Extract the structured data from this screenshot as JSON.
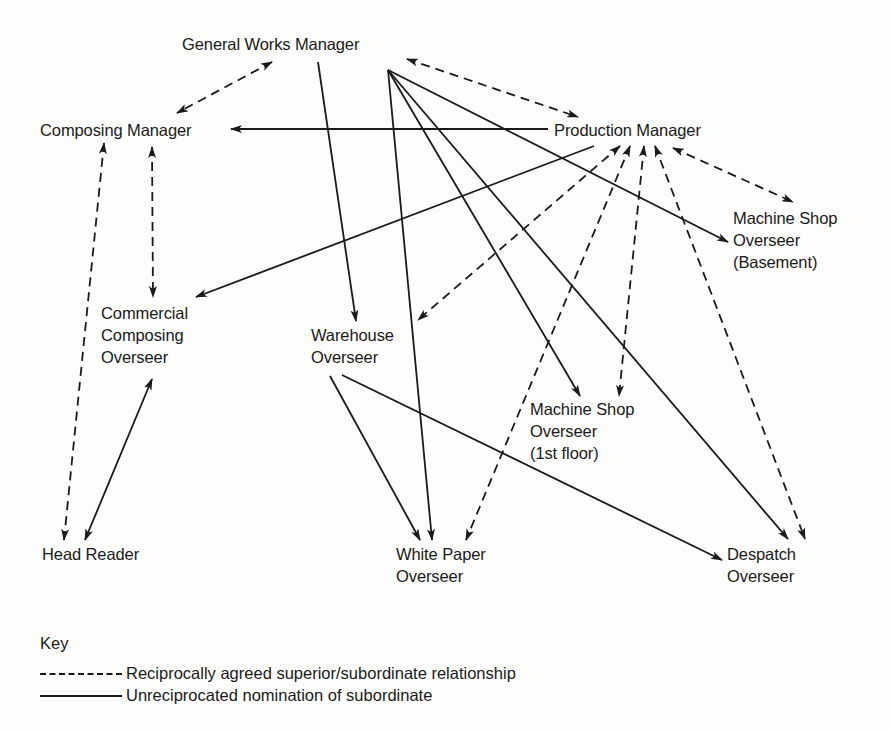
{
  "diagram": {
    "nodes": [
      {
        "id": "gwm",
        "lines": [
          "General Works Manager"
        ],
        "x": 182,
        "y": 33
      },
      {
        "id": "cm",
        "lines": [
          "Composing Manager"
        ],
        "x": 40,
        "y": 119
      },
      {
        "id": "pm",
        "lines": [
          "Production Manager"
        ],
        "x": 554,
        "y": 119
      },
      {
        "id": "msb",
        "lines": [
          "Machine Shop",
          "Overseer",
          "(Basement)"
        ],
        "x": 733,
        "y": 207
      },
      {
        "id": "cco",
        "lines": [
          "Commercial",
          "Composing",
          "Overseer"
        ],
        "x": 101,
        "y": 302
      },
      {
        "id": "wo",
        "lines": [
          "Warehouse",
          "Overseer"
        ],
        "x": 311,
        "y": 324
      },
      {
        "id": "ms1",
        "lines": [
          "Machine Shop",
          "Overseer",
          "(1st floor)"
        ],
        "x": 530,
        "y": 398
      },
      {
        "id": "hr",
        "lines": [
          "Head Reader"
        ],
        "x": 42,
        "y": 543
      },
      {
        "id": "wpo",
        "lines": [
          "White Paper",
          "Overseer"
        ],
        "x": 396,
        "y": 543
      },
      {
        "id": "do",
        "lines": [
          "Despatch",
          "Overseer"
        ],
        "x": 727,
        "y": 543
      }
    ],
    "edges": [
      {
        "from": "gwm",
        "to": "cm",
        "style": "dashed",
        "x1": 272,
        "y1": 62,
        "x2": 177,
        "y2": 113,
        "arrows": "both"
      },
      {
        "from": "gwm",
        "to": "pm",
        "style": "dashed",
        "x1": 407,
        "y1": 59,
        "x2": 578,
        "y2": 117,
        "arrows": "both"
      },
      {
        "from": "pm",
        "to": "cm",
        "style": "solid",
        "x1": 548,
        "y1": 129,
        "x2": 231,
        "y2": 129,
        "arrows": "end"
      },
      {
        "from": "gwm",
        "to": "wo",
        "style": "solid",
        "x1": 318,
        "y1": 62,
        "x2": 356,
        "y2": 321,
        "arrows": "end"
      },
      {
        "from": "gwm",
        "to": "wpo",
        "style": "solid",
        "x1": 388,
        "y1": 70,
        "x2": 432,
        "y2": 540,
        "arrows": "end"
      },
      {
        "from": "gwm",
        "to": "ms1",
        "style": "solid",
        "x1": 388,
        "y1": 70,
        "x2": 580,
        "y2": 396,
        "arrows": "end"
      },
      {
        "from": "gwm",
        "to": "do",
        "style": "solid",
        "x1": 388,
        "y1": 70,
        "x2": 788,
        "y2": 539,
        "arrows": "end"
      },
      {
        "from": "gwm",
        "to": "msb",
        "style": "solid",
        "x1": 388,
        "y1": 70,
        "x2": 728,
        "y2": 242,
        "arrows": "end"
      },
      {
        "from": "pm",
        "to": "cco",
        "style": "solid",
        "x1": 594,
        "y1": 146,
        "x2": 196,
        "y2": 297,
        "arrows": "end"
      },
      {
        "from": "pm",
        "to": "wo",
        "style": "dashed",
        "x1": 620,
        "y1": 146,
        "x2": 418,
        "y2": 320,
        "arrows": "both"
      },
      {
        "from": "pm",
        "to": "wpo",
        "style": "dashed",
        "x1": 630,
        "y1": 146,
        "x2": 466,
        "y2": 540,
        "arrows": "both"
      },
      {
        "from": "pm",
        "to": "ms1",
        "style": "dashed",
        "x1": 644,
        "y1": 146,
        "x2": 619,
        "y2": 396,
        "arrows": "both"
      },
      {
        "from": "pm",
        "to": "do",
        "style": "dashed",
        "x1": 655,
        "y1": 146,
        "x2": 805,
        "y2": 539,
        "arrows": "both"
      },
      {
        "from": "pm",
        "to": "msb",
        "style": "dashed",
        "x1": 673,
        "y1": 148,
        "x2": 793,
        "y2": 202,
        "arrows": "both"
      },
      {
        "from": "cm",
        "to": "hr",
        "style": "dashed",
        "x1": 104,
        "y1": 143,
        "x2": 64,
        "y2": 540,
        "arrows": "both"
      },
      {
        "from": "cm",
        "to": "cco",
        "style": "dashed",
        "x1": 152,
        "y1": 147,
        "x2": 153,
        "y2": 297,
        "arrows": "both"
      },
      {
        "from": "hr",
        "to": "cco",
        "style": "solid",
        "x1": 85,
        "y1": 540,
        "x2": 152,
        "y2": 379,
        "arrows": "both"
      },
      {
        "from": "wo",
        "to": "wpo",
        "style": "solid",
        "x1": 330,
        "y1": 376,
        "x2": 420,
        "y2": 540,
        "arrows": "end"
      },
      {
        "from": "wo",
        "to": "do",
        "style": "solid",
        "x1": 342,
        "y1": 375,
        "x2": 722,
        "y2": 560,
        "arrows": "end"
      }
    ]
  },
  "key": {
    "title": "Key",
    "items": [
      {
        "style": "dashed",
        "label": "Reciprocally agreed superior/subordinate relationship"
      },
      {
        "style": "solid",
        "label": "Unreciprocated nomination of subordinate"
      }
    ]
  },
  "colors": {
    "ink": "#1a1a1a",
    "paper": "#fdfdfc"
  }
}
